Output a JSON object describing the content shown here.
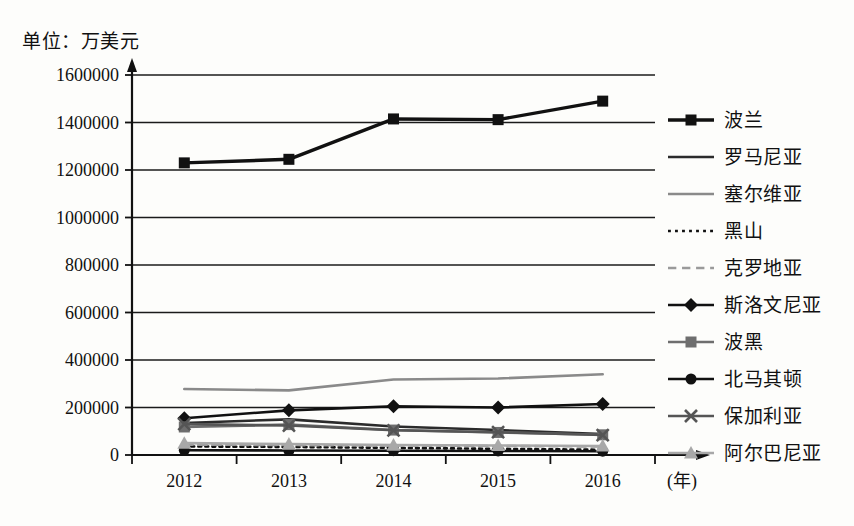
{
  "unit_note": "单位：万美元",
  "chart_data": {
    "type": "line",
    "title": "单位：万美元",
    "xlabel": "(年)",
    "ylabel": "",
    "categories": [
      "2012",
      "2013",
      "2014",
      "2015",
      "2016"
    ],
    "x": [
      2012,
      2013,
      2014,
      2015,
      2016
    ],
    "ylim": [
      0,
      1600000
    ],
    "ytick_labels": [
      "0",
      "200000",
      "400000",
      "600000",
      "800000",
      "1000000",
      "1200000",
      "1400000",
      "1600000"
    ],
    "ytick_values": [
      0,
      200000,
      400000,
      600000,
      800000,
      1000000,
      1200000,
      1400000,
      1600000
    ],
    "grid": true,
    "legend_position": "right",
    "series": [
      {
        "name": "波兰",
        "marker": "square",
        "color": "#111111",
        "linestyle": "solid",
        "values": [
          1230000,
          1245000,
          1415000,
          1412000,
          1490000
        ]
      },
      {
        "name": "罗马尼亚",
        "marker": "none",
        "color": "#2b2b2b",
        "linestyle": "solid",
        "values": [
          135000,
          150000,
          120000,
          105000,
          88000
        ]
      },
      {
        "name": "塞尔维亚",
        "marker": "none",
        "color": "#8a8a8a",
        "linestyle": "solid",
        "values": [
          278000,
          272000,
          318000,
          322000,
          340000
        ]
      },
      {
        "name": "黑山",
        "marker": "none",
        "color": "#111111",
        "linestyle": "dotted",
        "values": [
          36000,
          34000,
          30000,
          26000,
          22000
        ]
      },
      {
        "name": "克罗地亚",
        "marker": "none",
        "color": "#9a9a9a",
        "linestyle": "dashed",
        "values": [
          44000,
          42000,
          40000,
          38000,
          36000
        ]
      },
      {
        "name": "斯洛文尼亚",
        "marker": "diamond",
        "color": "#111111",
        "linestyle": "solid",
        "values": [
          155000,
          188000,
          205000,
          200000,
          215000
        ]
      },
      {
        "name": "波黑",
        "marker": "square",
        "color": "#6e6e6e",
        "linestyle": "solid",
        "values": [
          118000,
          128000,
          105000,
          95000,
          85000
        ]
      },
      {
        "name": "北马其顿",
        "marker": "circle",
        "color": "#111111",
        "linestyle": "solid",
        "values": [
          20000,
          19000,
          18000,
          17000,
          16000
        ]
      },
      {
        "name": "保加利亚",
        "marker": "x",
        "color": "#555555",
        "linestyle": "solid",
        "values": [
          130000,
          124000,
          104000,
          96000,
          84000
        ]
      },
      {
        "name": "阿尔巴尼亚",
        "marker": "triangle",
        "color": "#a8a8a8",
        "linestyle": "solid",
        "values": [
          50000,
          46000,
          42000,
          40000,
          38000
        ]
      }
    ]
  }
}
